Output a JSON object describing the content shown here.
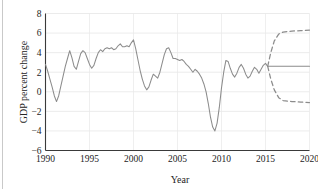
{
  "chart_data": {
    "type": "line",
    "title": "",
    "xlabel": "Year",
    "ylabel": "GDP percent change",
    "xlim": [
      1990,
      2020
    ],
    "ylim": [
      -6,
      8
    ],
    "xticks": [
      1990,
      1995,
      2000,
      2005,
      2010,
      2015,
      2020
    ],
    "xtick_labels": [
      "1990",
      "1995",
      "2000",
      "2005",
      "2010",
      "2015",
      "2020"
    ],
    "yticks": [
      -6,
      -4,
      -2,
      0,
      2,
      4,
      6,
      8
    ],
    "ytick_labels": [
      "−6",
      "−4",
      "−2",
      "0",
      "2",
      "4",
      "6",
      "8"
    ],
    "grid": true,
    "legend": "none",
    "line_color": "#8c8c8c",
    "series": [
      {
        "name": "historical GDP percent change",
        "style": "solid",
        "x": [
          1990.0,
          1990.25,
          1990.5,
          1990.75,
          1991.0,
          1991.25,
          1991.5,
          1991.75,
          1992.0,
          1992.25,
          1992.5,
          1992.75,
          1993.0,
          1993.25,
          1993.5,
          1993.75,
          1994.0,
          1994.25,
          1994.5,
          1994.75,
          1995.0,
          1995.25,
          1995.5,
          1995.75,
          1996.0,
          1996.25,
          1996.5,
          1996.75,
          1997.0,
          1997.25,
          1997.5,
          1997.75,
          1998.0,
          1998.25,
          1998.5,
          1998.75,
          1999.0,
          1999.25,
          1999.5,
          1999.75,
          2000.0,
          2000.25,
          2000.5,
          2000.75,
          2001.0,
          2001.25,
          2001.5,
          2001.75,
          2002.0,
          2002.25,
          2002.5,
          2002.75,
          2003.0,
          2003.25,
          2003.5,
          2003.75,
          2004.0,
          2004.25,
          2004.5,
          2004.75,
          2005.0,
          2005.25,
          2005.5,
          2005.75,
          2006.0,
          2006.25,
          2006.5,
          2006.75,
          2007.0,
          2007.25,
          2007.5,
          2007.75,
          2008.0,
          2008.25,
          2008.5,
          2008.75,
          2009.0,
          2009.25,
          2009.5,
          2009.75,
          2010.0,
          2010.25,
          2010.5,
          2010.75,
          2011.0,
          2011.25,
          2011.5,
          2011.75,
          2012.0,
          2012.25,
          2012.5,
          2012.75,
          2013.0,
          2013.25,
          2013.5,
          2013.75,
          2014.0,
          2014.25,
          2014.5,
          2014.75,
          2015.0,
          2015.25
        ],
        "y": [
          2.8,
          2.1,
          1.3,
          0.5,
          -0.4,
          -1.0,
          -0.4,
          0.6,
          1.6,
          2.6,
          3.4,
          4.2,
          3.5,
          2.6,
          2.3,
          3.1,
          3.9,
          4.2,
          4.0,
          3.4,
          2.8,
          2.4,
          2.7,
          3.4,
          4.0,
          4.3,
          4.1,
          4.4,
          4.5,
          4.4,
          4.5,
          4.3,
          4.4,
          4.7,
          4.9,
          4.6,
          4.6,
          4.7,
          4.6,
          5.0,
          5.3,
          4.4,
          3.3,
          2.2,
          1.3,
          0.6,
          0.2,
          0.5,
          1.2,
          1.8,
          1.6,
          1.4,
          2.0,
          2.9,
          3.8,
          4.4,
          4.5,
          4.0,
          3.4,
          3.4,
          3.3,
          3.2,
          3.3,
          3.1,
          2.8,
          2.6,
          2.3,
          2.0,
          2.3,
          2.1,
          1.8,
          1.4,
          0.8,
          0.0,
          -1.2,
          -2.6,
          -3.6,
          -4.0,
          -3.2,
          -1.6,
          0.4,
          2.0,
          3.2,
          3.1,
          2.4,
          1.8,
          1.5,
          1.9,
          2.5,
          2.8,
          2.4,
          1.8,
          1.4,
          1.6,
          2.1,
          2.5,
          2.3,
          1.9,
          2.3,
          2.7,
          2.9,
          2.6
        ]
      },
      {
        "name": "forecast central projection",
        "style": "solid",
        "x": [
          2015.25,
          2016,
          2017,
          2018,
          2019,
          2020
        ],
        "y": [
          2.6,
          2.6,
          2.6,
          2.6,
          2.6,
          2.6
        ]
      },
      {
        "name": "forecast upper bound",
        "style": "dashed",
        "x": [
          2015.25,
          2015.6,
          2016.0,
          2016.5,
          2017.0,
          2018.0,
          2019.0,
          2020.0
        ],
        "y": [
          2.6,
          4.0,
          5.2,
          5.9,
          6.1,
          6.2,
          6.25,
          6.3
        ]
      },
      {
        "name": "forecast lower bound",
        "style": "dashed",
        "x": [
          2015.25,
          2015.6,
          2016.0,
          2016.5,
          2017.0,
          2018.0,
          2019.0,
          2020.0
        ],
        "y": [
          2.6,
          1.3,
          0.2,
          -0.6,
          -0.9,
          -1.0,
          -1.05,
          -1.1
        ]
      }
    ]
  }
}
